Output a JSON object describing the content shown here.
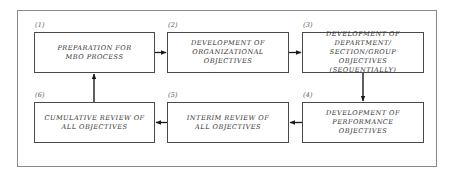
{
  "diagram": {
    "type": "flowchart",
    "steps": [
      {
        "number": "(1)",
        "text": "PREPARATION FOR\nMBO PROCESS"
      },
      {
        "number": "(2)",
        "text": "DEVELOPMENT OF\nORGANIZATIONAL OBJECTIVES"
      },
      {
        "number": "(3)",
        "text": "DEVELOPMENT OF DEPARTMENT/\nSECTION/GROUP OBJECTIVES\n(SEQUENTIALLY)"
      },
      {
        "number": "(4)",
        "text": "DEVELOPMENT OF PERFORMANCE\nOBJECTIVES"
      },
      {
        "number": "(5)",
        "text": "INTERIM REVIEW OF\nALL OBJECTIVES"
      },
      {
        "number": "(6)",
        "text": "CUMULATIVE REVIEW OF\nALL OBJECTIVES"
      }
    ],
    "connections": [
      {
        "from": "(1)",
        "to": "(2)",
        "direction": "right"
      },
      {
        "from": "(2)",
        "to": "(3)",
        "direction": "right"
      },
      {
        "from": "(3)",
        "to": "(4)",
        "direction": "down"
      },
      {
        "from": "(4)",
        "to": "(5)",
        "direction": "left"
      },
      {
        "from": "(5)",
        "to": "(6)",
        "direction": "left"
      },
      {
        "from": "(6)",
        "to": "(1)",
        "direction": "up"
      }
    ]
  }
}
